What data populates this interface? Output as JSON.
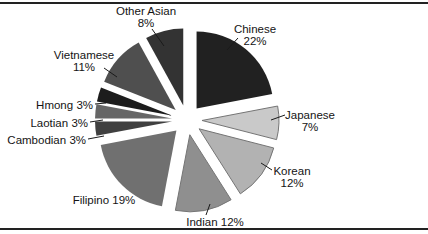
{
  "chart_data": {
    "type": "pie",
    "title": "",
    "exploded": true,
    "start_angle_deg": 0,
    "direction": "clockwise",
    "unit": "%",
    "background": "#ffffff",
    "border_line_color": "#222222",
    "label_color": "#141414",
    "slices": [
      {
        "id": "chinese",
        "label": "Chinese",
        "value": 22,
        "pct_display": "22%",
        "color": "#212121"
      },
      {
        "id": "japanese",
        "label": "Japanese",
        "value": 7,
        "pct_display": "7%",
        "color": "#c9c9c9"
      },
      {
        "id": "korean",
        "label": "Korean",
        "value": 12,
        "pct_display": "12%",
        "color": "#b2b2b2"
      },
      {
        "id": "indian",
        "label": "Indian",
        "value": 12,
        "pct_display": "12%",
        "color": "#8f8f8f"
      },
      {
        "id": "filipino",
        "label": "Filipino",
        "value": 19,
        "pct_display": "19%",
        "color": "#707070"
      },
      {
        "id": "cambodian",
        "label": "Cambodian",
        "value": 3,
        "pct_display": "3%",
        "color": "#404040"
      },
      {
        "id": "laotian",
        "label": "Laotian",
        "value": 3,
        "pct_display": "3%",
        "color": "#666666"
      },
      {
        "id": "hmong",
        "label": "Hmong",
        "value": 3,
        "pct_display": "3%",
        "color": "#1c1c1c"
      },
      {
        "id": "vietnamese",
        "label": "Vietnamese",
        "value": 11,
        "pct_display": "11%",
        "color": "#4f4f4f"
      },
      {
        "id": "other_asian",
        "label": "Other Asian",
        "value": 8,
        "pct_display": "8%",
        "color": "#333333"
      }
    ]
  }
}
